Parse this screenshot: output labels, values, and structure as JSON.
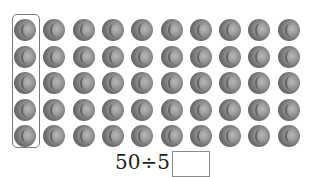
{
  "figure": {
    "rows": 5,
    "columns": 10,
    "total_objects": 50,
    "object_icon": "baseball-icon",
    "highlighted_group": {
      "column": 1,
      "count": 5
    },
    "colors": {
      "ball": "#7a7a7a",
      "box_border": "#7a7a7a",
      "text": "#222222"
    }
  },
  "equation": {
    "text": "50÷5=",
    "answer_placeholder": ""
  }
}
